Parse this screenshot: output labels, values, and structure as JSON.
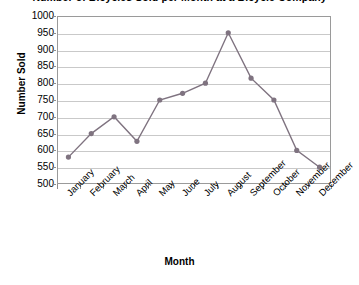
{
  "chart_data": {
    "type": "line",
    "title": "Number of Bicycles Sold per Month at a Bicycle Company",
    "xlabel": "Month",
    "ylabel": "Number Sold",
    "categories": [
      "January",
      "February",
      "March",
      "April",
      "May",
      "June",
      "July",
      "August",
      "September",
      "October",
      "November",
      "December"
    ],
    "series": [
      {
        "name": "Number Sold",
        "values": [
          580,
          650,
          700,
          627,
          750,
          770,
          800,
          950,
          815,
          750,
          600,
          550
        ],
        "color": "#7f7380",
        "marker": "circle"
      }
    ],
    "ylim": [
      500,
      1000
    ],
    "ytick_step": 50,
    "yticks": [
      1000,
      950,
      900,
      850,
      800,
      750,
      700,
      650,
      600,
      550,
      500
    ],
    "grid": true,
    "legend": "none",
    "xtick_label_rotation": -45
  },
  "colors": {
    "series": "#7f7380",
    "grid": "#c9c9c9",
    "frame": "#9a9a9a",
    "text": "#000000",
    "background": "#ffffff"
  }
}
